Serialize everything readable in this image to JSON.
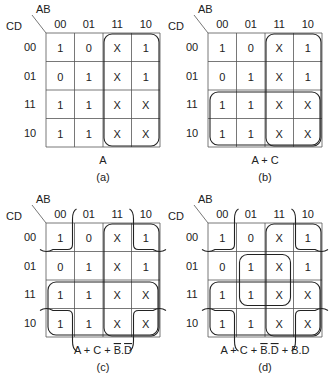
{
  "maps": [
    {
      "id": "a",
      "origin": [
        46,
        33
      ],
      "row_var": "CD",
      "col_var": "AB",
      "col_labels": [
        "00",
        "01",
        "11",
        "10"
      ],
      "row_labels": [
        "00",
        "01",
        "11",
        "10"
      ],
      "cells": [
        [
          "1",
          "0",
          "X",
          "1"
        ],
        [
          "0",
          "1",
          "X",
          "1"
        ],
        [
          "1",
          "1",
          "X",
          "X"
        ],
        [
          "1",
          "1",
          "X",
          "X"
        ]
      ],
      "expression": "A",
      "caption": "(a)",
      "groups": [
        "A"
      ]
    },
    {
      "id": "b",
      "origin": [
        208,
        33
      ],
      "row_var": "CD",
      "col_var": "AB",
      "col_labels": [
        "00",
        "01",
        "11",
        "10"
      ],
      "row_labels": [
        "00",
        "01",
        "11",
        "10"
      ],
      "cells": [
        [
          "1",
          "0",
          "X",
          "1"
        ],
        [
          "0",
          "1",
          "X",
          "1"
        ],
        [
          "1",
          "1",
          "X",
          "X"
        ],
        [
          "1",
          "1",
          "X",
          "X"
        ]
      ],
      "expression": "A + C",
      "caption": "(b)",
      "groups": [
        "A",
        "C"
      ]
    },
    {
      "id": "c",
      "origin": [
        46,
        223
      ],
      "row_var": "CD",
      "col_var": "AB",
      "col_labels": [
        "00",
        "01",
        "11",
        "10"
      ],
      "row_labels": [
        "00",
        "01",
        "11",
        "10"
      ],
      "cells": [
        [
          "1",
          "0",
          "X",
          "1"
        ],
        [
          "0",
          "1",
          "X",
          "1"
        ],
        [
          "1",
          "1",
          "X",
          "X"
        ],
        [
          "1",
          "1",
          "X",
          "X"
        ]
      ],
      "expression_parts": [
        "A + C + ",
        "B",
        ".",
        "D"
      ],
      "expression": "A + C + B̄.D̄",
      "caption": "(c)",
      "groups": [
        "A",
        "C",
        "B'.D'"
      ]
    },
    {
      "id": "d",
      "origin": [
        208,
        223
      ],
      "row_var": "CD",
      "col_var": "AB",
      "col_labels": [
        "00",
        "01",
        "11",
        "10"
      ],
      "row_labels": [
        "00",
        "01",
        "11",
        "10"
      ],
      "cells": [
        [
          "1",
          "0",
          "X",
          "1"
        ],
        [
          "0",
          "1",
          "X",
          "1"
        ],
        [
          "1",
          "1",
          "X",
          "X"
        ],
        [
          "1",
          "1",
          "X",
          "X"
        ]
      ],
      "expression_parts": [
        "A + C + ",
        "B",
        ".",
        "D",
        " + B.D"
      ],
      "expression": "A + C + B̄.D̄ + B.D",
      "caption": "(d)",
      "groups": [
        "A",
        "C",
        "B'.D'",
        "B.D"
      ]
    }
  ]
}
